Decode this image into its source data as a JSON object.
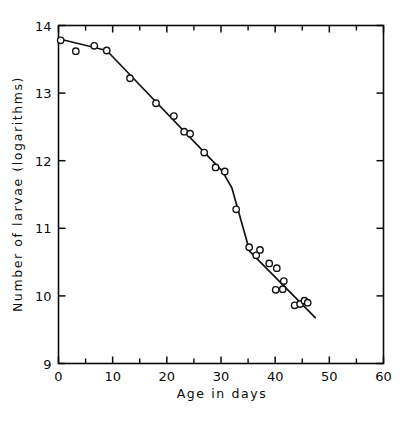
{
  "chart_data": {
    "type": "scatter",
    "title": "",
    "xlabel": "Age in days",
    "ylabel": "Number of larvae (logarithms)",
    "xlim": [
      0,
      60
    ],
    "ylim": [
      9,
      14
    ],
    "xticks": [
      0,
      10,
      20,
      30,
      40,
      50,
      60
    ],
    "xticklabels": [
      "0",
      "10",
      "20",
      "30",
      "40",
      "50",
      "60"
    ],
    "xminorticks": [
      5,
      15,
      25,
      35,
      45,
      55
    ],
    "yticks": [
      9,
      10,
      11,
      12,
      13,
      14
    ],
    "yticklabels": [
      "9",
      "10",
      "11",
      "12",
      "13",
      "14"
    ],
    "grid": false,
    "legend": null,
    "frame": "box",
    "tick_direction": "in",
    "marker": "open-circle",
    "series": [
      {
        "name": "Number of larvae",
        "x": [
          0.4,
          3.2,
          6.6,
          8.9,
          13.2,
          18.0,
          21.3,
          23.2,
          24.3,
          26.9,
          29.0,
          30.7,
          32.8,
          35.2,
          36.5,
          37.2,
          38.9,
          40.3,
          41.6,
          40.1,
          41.4,
          43.6,
          44.6,
          45.4,
          46.0
        ],
        "y": [
          13.78,
          13.62,
          13.7,
          13.63,
          13.22,
          12.85,
          12.66,
          12.43,
          12.4,
          12.12,
          11.9,
          11.84,
          11.28,
          10.72,
          10.6,
          10.68,
          10.48,
          10.41,
          10.22,
          10.09,
          10.1,
          9.86,
          9.88,
          9.93,
          9.9
        ]
      }
    ],
    "fit_line": {
      "name": "fitted piecewise trend",
      "x": [
        0.2,
        8.9,
        30.2,
        32.0,
        35.3,
        47.4
      ],
      "y": [
        13.8,
        13.63,
        11.85,
        11.6,
        10.66,
        9.68
      ]
    }
  }
}
